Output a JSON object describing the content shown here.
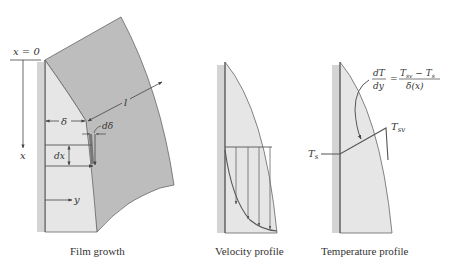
{
  "colors": {
    "background": "#ffffff",
    "wall": "#d4d4d4",
    "film_light": "#e6e6e6",
    "vapor_dark": "#bdbdbd",
    "line": "#555555",
    "text": "#333333"
  },
  "film_growth": {
    "caption": "Film growth",
    "origin_label": "x = 0",
    "x_axis_label": "x",
    "y_axis_label": "y",
    "delta_label": "δ",
    "length_label": "l",
    "d_delta_label": "dδ",
    "dx_label": "dx"
  },
  "velocity_profile": {
    "caption": "Velocity profile",
    "arrow_count": 4
  },
  "temperature_profile": {
    "caption": "Temperature profile",
    "ts_label": "T",
    "ts_sub": "s",
    "tsv_label": "T",
    "tsv_sub": "sv",
    "equation": {
      "lhs_num": "dT",
      "lhs_den": "dy",
      "equals": "=",
      "rhs_num_a": "T",
      "rhs_num_a_sub": "sv",
      "rhs_minus": " − ",
      "rhs_num_b": "T",
      "rhs_num_b_sub": "s",
      "rhs_den": "δ(x)"
    }
  }
}
